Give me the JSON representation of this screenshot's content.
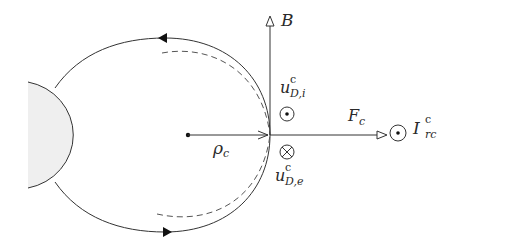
{
  "diagram": {
    "type": "physics-field-diagram",
    "colors": {
      "stroke": "#333333",
      "disk_fill": "#efefef",
      "dashed": "#555555"
    },
    "labels": {
      "magnetic_field": "B",
      "force": "F",
      "force_sub": "c",
      "radius": "ρ",
      "radius_sub": "c",
      "drift_ion": "u",
      "drift_ion_sup": "c",
      "drift_ion_sub": "D,i",
      "drift_electron": "u",
      "drift_electron_sup": "c",
      "drift_electron_sub": "D,e",
      "ring_current": "I",
      "ring_current_sup": "c",
      "ring_current_sub": "rc"
    },
    "symbols": {
      "drift_ion_direction": "out-of-page (dot)",
      "drift_electron_direction": "into-page (cross)",
      "ring_current_direction": "out-of-page (dot)"
    },
    "icons": {
      "field_line_arrow_top": "arrow-left-icon",
      "field_line_arrow_bottom": "arrow-right-icon"
    }
  }
}
